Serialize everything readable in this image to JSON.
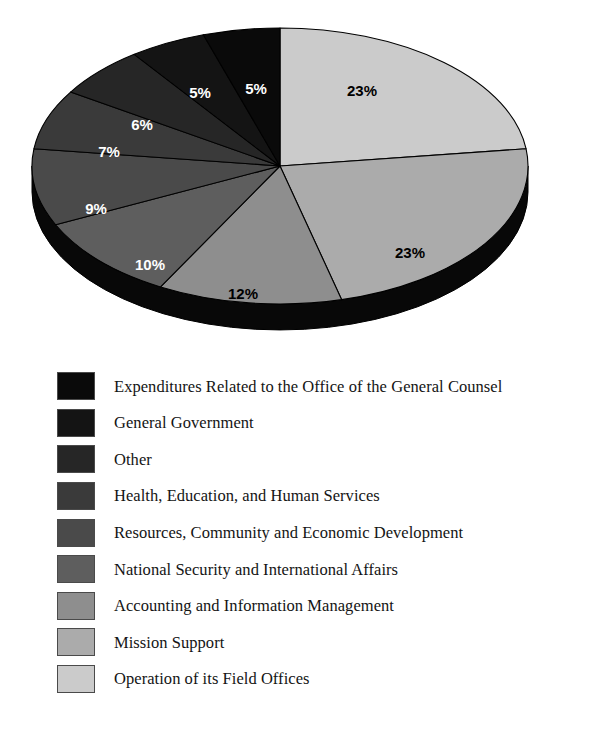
{
  "figure": {
    "title_remnant": "··",
    "background_color": "#ffffff"
  },
  "chart_data": {
    "type": "pie",
    "title": "",
    "subtitle": "",
    "xlabel": "",
    "ylabel": "",
    "legend_position": "below",
    "grid": false,
    "value_suffix": "%",
    "total": 100,
    "start_angle_deg": 0,
    "direction": "clockwise",
    "three_d": true,
    "categories": [
      "Operation of its Field Offices",
      "Mission Support",
      "Accounting and Information Management",
      "National Security and International Affairs",
      "Resources, Community and Economic Development",
      "Health, Education, and Human Services",
      "Other",
      "General Government",
      "Expenditures Related to the Office of the General Counsel"
    ],
    "values": [
      23,
      23,
      12,
      10,
      9,
      7,
      6,
      5,
      5
    ],
    "labels": [
      "23%",
      "23%",
      "12%",
      "10%",
      "9%",
      "7%",
      "6%",
      "5%",
      "5%"
    ],
    "colors": [
      "#cbcbcb",
      "#ababab",
      "#8e8e8e",
      "#5e5e5e",
      "#4a4a4a",
      "#3a3a3a",
      "#262626",
      "#141414",
      "#0a0a0a"
    ],
    "label_text_colors": [
      "#000000",
      "#000000",
      "#000000",
      "#ffffff",
      "#ffffff",
      "#ffffff",
      "#ffffff",
      "#ffffff",
      "#ffffff"
    ],
    "slices": [
      {
        "label": "23%",
        "value": 23,
        "name": "Operation of its Field Offices",
        "color": "#cbcbcb",
        "label_x": 362,
        "label_y": 78,
        "label_color": "#000000"
      },
      {
        "label": "23%",
        "value": 23,
        "name": "Mission Support",
        "color": "#ababab",
        "label_x": 410,
        "label_y": 240,
        "label_color": "#000000"
      },
      {
        "label": "12%",
        "value": 12,
        "name": "Accounting and Information Management",
        "color": "#8e8e8e",
        "label_x": 243,
        "label_y": 281,
        "label_color": "#000000"
      },
      {
        "label": "10%",
        "value": 10,
        "name": "National Security and International Affairs",
        "color": "#5e5e5e",
        "label_x": 150,
        "label_y": 252,
        "label_color": "#ffffff"
      },
      {
        "label": "9%",
        "value": 9,
        "name": "Resources, Community and Economic Development",
        "color": "#4a4a4a",
        "label_x": 96,
        "label_y": 196,
        "label_color": "#ffffff"
      },
      {
        "label": "7%",
        "value": 7,
        "name": "Health, Education, and Human Services",
        "color": "#3a3a3a",
        "label_x": 109,
        "label_y": 139,
        "label_color": "#ffffff"
      },
      {
        "label": "6%",
        "value": 6,
        "name": "Other",
        "color": "#262626",
        "label_x": 142,
        "label_y": 112,
        "label_color": "#ffffff"
      },
      {
        "label": "5%",
        "value": 5,
        "name": "General Government",
        "color": "#141414",
        "label_x": 200,
        "label_y": 80,
        "label_color": "#ffffff"
      },
      {
        "label": "5%",
        "value": 5,
        "name": "Expenditures Related to the Office of the General Counsel",
        "color": "#0a0a0a",
        "label_x": 256,
        "label_y": 76,
        "label_color": "#ffffff"
      }
    ]
  },
  "legend": {
    "items": [
      {
        "label": "Expenditures Related to the Office of the General Counsel",
        "color": "#0a0a0a",
        "value": "5%"
      },
      {
        "label": "General Government",
        "color": "#141414",
        "value": "5%"
      },
      {
        "label": "Other",
        "color": "#262626",
        "value": "6%"
      },
      {
        "label": "Health, Education, and Human Services",
        "color": "#3a3a3a",
        "value": "7%"
      },
      {
        "label": "Resources, Community and Economic Development",
        "color": "#4a4a4a",
        "value": "9%"
      },
      {
        "label": "National Security and International Affairs",
        "color": "#5e5e5e",
        "value": "10%"
      },
      {
        "label": "Accounting and Information Management",
        "color": "#8e8e8e",
        "value": "12%"
      },
      {
        "label": "Mission Support",
        "color": "#ababab",
        "value": "23%"
      },
      {
        "label": "Operation of its Field Offices",
        "color": "#cbcbcb",
        "value": "23%"
      }
    ]
  }
}
